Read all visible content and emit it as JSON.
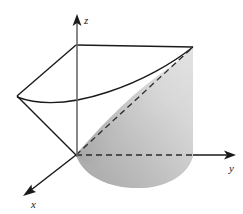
{
  "figure": {
    "title": "",
    "kind": "3d-surface-sketch",
    "background_color": "#ffffff",
    "line_color": "#1a1a1a",
    "dashed_color": "#2b2b2b",
    "surface_fill_light": "#e8e8e8",
    "surface_fill_mid": "#c9c9c9",
    "surface_fill_dark": "#a8a8a8"
  },
  "axes": {
    "origin": {
      "x": 76,
      "y": 155
    },
    "items": [
      {
        "name": "z",
        "label": "z",
        "label_position": {
          "x": 84,
          "y": 24
        },
        "arrow_tip": {
          "x": 77,
          "y": 16
        },
        "start": {
          "x": 77,
          "y": 157
        },
        "direction": "up"
      },
      {
        "name": "y",
        "label": "y",
        "label_position": {
          "x": 229,
          "y": 172
        },
        "arrow_tip": {
          "x": 234,
          "y": 155
        },
        "start": {
          "x": 193,
          "y": 155
        },
        "direction": "right"
      },
      {
        "name": "x",
        "label": "x",
        "label_position": {
          "x": 32,
          "y": 207
        },
        "arrow_tip": {
          "x": 24,
          "y": 195
        },
        "start": {
          "x": 76,
          "y": 155
        },
        "direction": "down-left"
      }
    ]
  },
  "geometry": {
    "top_plane": {
      "name": "top-plane-quadrilateral",
      "vertices": [
        {
          "x": 76,
          "y": 45
        },
        {
          "x": 193,
          "y": 47
        },
        {
          "x": 17,
          "y": 96
        }
      ],
      "note": "top rectangle edge from z-axis to right corner, plus left slanted edges to back vertex"
    },
    "left_vertex": {
      "x": 17,
      "y": 96
    },
    "top_right_corner": {
      "x": 193,
      "y": 47
    },
    "top_left_corner": {
      "x": 76,
      "y": 45
    },
    "parabola_top": {
      "name": "upper-parabola-curve",
      "start": {
        "x": 17,
        "y": 99
      },
      "through": {
        "x": 100,
        "y": 96
      },
      "end": {
        "x": 193,
        "y": 47
      }
    },
    "dashed_diagonal": {
      "name": "dashed-diagonal-edge",
      "start": {
        "x": 76,
        "y": 155
      },
      "end": {
        "x": 193,
        "y": 47
      }
    },
    "dashed_y_segment": {
      "name": "dashed-y-axis-hidden-segment",
      "start": {
        "x": 76,
        "y": 155
      },
      "end": {
        "x": 193,
        "y": 155
      }
    },
    "base_ellipse": {
      "name": "base-parabolic-region",
      "left_tip": {
        "x": 76,
        "y": 155
      },
      "right_edge": {
        "x": 193,
        "y": 155
      },
      "bottom": {
        "x": 140,
        "y": 188
      }
    }
  },
  "annotations": []
}
